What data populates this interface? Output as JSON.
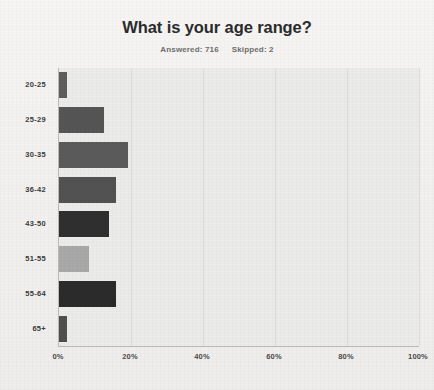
{
  "chart_data": {
    "type": "bar",
    "orientation": "horizontal",
    "title": "What is your age range?",
    "subtitle_answered_label": "Answered: 716",
    "subtitle_skipped_label": "Skipped: 2",
    "answered": 716,
    "skipped": 2,
    "xlabel": "",
    "ylabel": "",
    "xlim": [
      0,
      100
    ],
    "x_ticks": [
      0,
      20,
      40,
      60,
      80,
      100
    ],
    "x_tick_labels": [
      "0%",
      "20%",
      "40%",
      "60%",
      "80%",
      "100%"
    ],
    "grid": true,
    "legend": "none",
    "categories": [
      "20-25",
      "25-29",
      "30-35",
      "36-42",
      "43-50",
      "51-55",
      "55-64",
      "65+"
    ],
    "values": [
      2.2,
      12.5,
      19.2,
      15.8,
      13.9,
      8.3,
      15.8,
      2.2
    ],
    "bar_colors": [
      "#5d5d5d",
      "#555555",
      "#5a5a5a",
      "#525252",
      "#2f2f2f",
      "#a8a8a8",
      "#2b2b2b",
      "#4f4f4f"
    ],
    "bars": [
      {
        "category": "20-25",
        "value": 2.2,
        "color": "#5d5d5d"
      },
      {
        "category": "25-29",
        "value": 12.5,
        "color": "#555555"
      },
      {
        "category": "30-35",
        "value": 19.2,
        "color": "#5a5a5a"
      },
      {
        "category": "36-42",
        "value": 15.8,
        "color": "#525252"
      },
      {
        "category": "43-50",
        "value": 13.9,
        "color": "#2f2f2f"
      },
      {
        "category": "51-55",
        "value": 8.3,
        "color": "#a8a8a8"
      },
      {
        "category": "55-64",
        "value": 15.8,
        "color": "#2b2b2b"
      },
      {
        "category": "65+",
        "value": 2.2,
        "color": "#4f4f4f"
      }
    ]
  },
  "theme": {
    "page_background": "#f4f3f1",
    "plot_background": "#ebebe9",
    "gridline_color": "#dcdcda",
    "axis_color": "#b9b9b7",
    "title_color": "#2b2b2b",
    "subtitle_color": "#6d6d6d",
    "label_color": "#3a3a3a"
  }
}
